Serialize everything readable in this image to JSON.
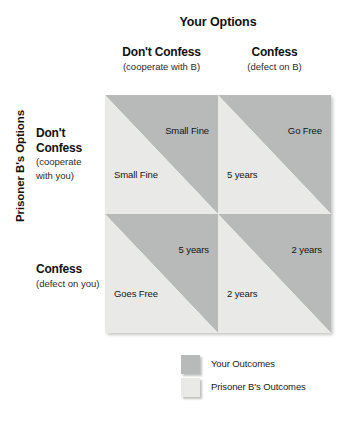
{
  "colors": {
    "your_outcome_fill": "#b7bab9",
    "prisoner_b_outcome_fill": "#e9eae8",
    "text": "#111111",
    "background": "#ffffff"
  },
  "column_axis": {
    "title": "Your Options",
    "headers": [
      {
        "main": "Don't Confess",
        "sub": "(cooperate with B)"
      },
      {
        "main": "Confess",
        "sub": "(defect on B)"
      }
    ]
  },
  "row_axis": {
    "title": "Prisoner B's Options",
    "headers": [
      {
        "main_line1": "Don't",
        "main_line2": "Confess",
        "sub_line1": "(cooperate",
        "sub_line2": "with you)"
      },
      {
        "main_line1": "Confess",
        "main_line2": "",
        "sub_line1": "(defect on you)",
        "sub_line2": ""
      }
    ]
  },
  "matrix": {
    "cells": [
      [
        {
          "your_outcome": "Small Fine",
          "prisoner_b_outcome": "Small Fine"
        },
        {
          "your_outcome": "Go Free",
          "prisoner_b_outcome": "5 years"
        }
      ],
      [
        {
          "your_outcome": "5 years",
          "prisoner_b_outcome": "Goes Free"
        },
        {
          "your_outcome": "2 years",
          "prisoner_b_outcome": "2 years"
        }
      ]
    ]
  },
  "legend": {
    "items": [
      {
        "label": "Your Outcomes",
        "swatch": "dark"
      },
      {
        "label": "Prisoner B's Outcomes",
        "swatch": "light"
      }
    ]
  }
}
